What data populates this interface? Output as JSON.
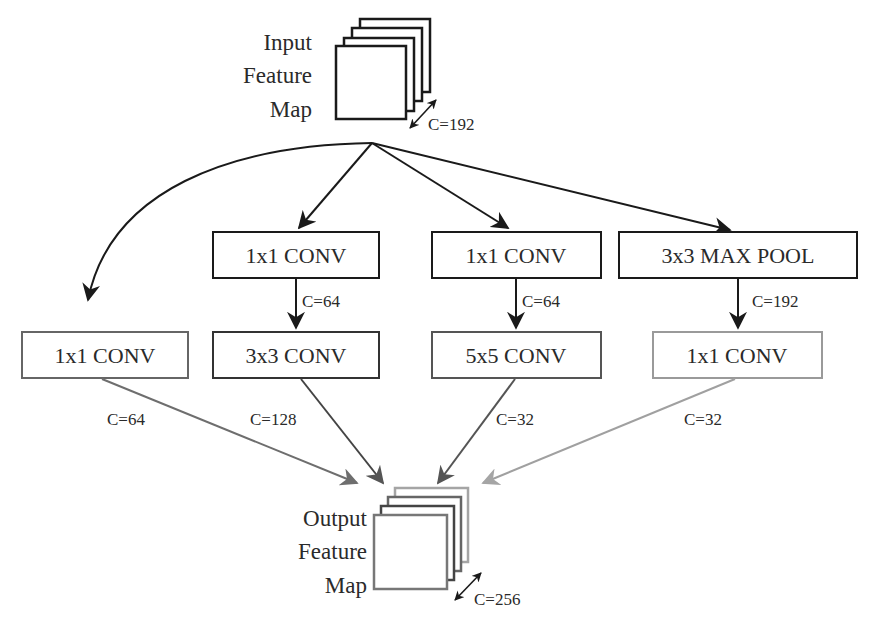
{
  "input_map": {
    "title_lines": [
      "Input",
      "Feature",
      "Map"
    ],
    "channels": "C=192"
  },
  "output_map": {
    "title_lines": [
      "Output",
      "Feature",
      "Map"
    ],
    "channels": "C=256"
  },
  "branches": [
    {
      "name": "branch-1x1",
      "first_box": "1x1 CONV",
      "output_channels": "C=64",
      "color": "#666666"
    },
    {
      "name": "branch-3x3",
      "reduce_box": "1x1 CONV",
      "reduce_channels": "C=64",
      "main_box": "3x3 CONV",
      "output_channels": "C=128",
      "color": "#444444"
    },
    {
      "name": "branch-5x5",
      "reduce_box": "1x1 CONV",
      "reduce_channels": "C=64",
      "main_box": "5x5 CONV",
      "output_channels": "C=32",
      "color": "#555555"
    },
    {
      "name": "branch-pool",
      "pool_box": "3x3 MAX POOL",
      "pool_channels": "C=192",
      "proj_box": "1x1 CONV",
      "output_channels": "C=32",
      "color": "#9a9a9a"
    }
  ],
  "colors": {
    "stroke_dark": "#1a1a1a",
    "stroke_gray": "#777777",
    "stroke_light": "#a0a0a0",
    "background": "#ffffff"
  }
}
